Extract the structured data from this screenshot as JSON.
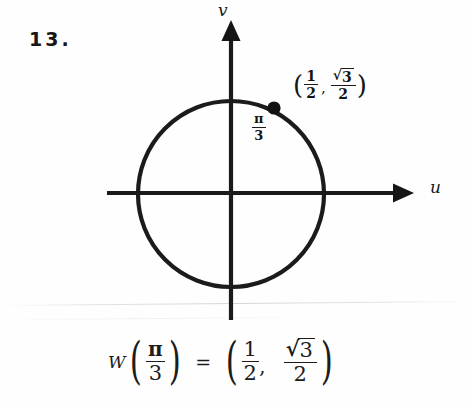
{
  "problem": {
    "number": "13."
  },
  "diagram": {
    "name": "unit-circle-diagram",
    "axes": {
      "vertical_label": "v",
      "horizontal_label": "u",
      "center_x": 231,
      "center_y": 194,
      "radius": 93,
      "v_axis_top": 22,
      "v_axis_bottom": 320,
      "u_axis_left": 107,
      "u_axis_right": 412,
      "stroke_color": "#1b1b1b",
      "stroke_width": 4
    },
    "point": {
      "name": "terminal-point",
      "x": 274,
      "y": 108,
      "radius": 6.5,
      "color": "#121212"
    },
    "angle_label": {
      "symbol": "π",
      "numerator": "π",
      "denominator": "3"
    },
    "point_label": {
      "open_paren": "(",
      "close_paren": ")",
      "comma": ",",
      "first_numerator": "1",
      "first_denominator": "2",
      "second_radical_sign": "√",
      "second_radicand": "3",
      "second_denominator": "2"
    }
  },
  "equation": {
    "function_name": "W",
    "open_paren": "(",
    "close_paren": ")",
    "argument_numerator": "π",
    "argument_denominator": "3",
    "equals": "=",
    "tuple_open_paren": "(",
    "tuple_close_paren": ")",
    "tuple_comma": ",",
    "first_numerator": "1",
    "first_denominator": "2",
    "second_radical_sign": "√",
    "second_radicand": "3",
    "second_denominator": "2"
  },
  "colors": {
    "ink": "#1b1b1b",
    "page": "#fefefe"
  }
}
